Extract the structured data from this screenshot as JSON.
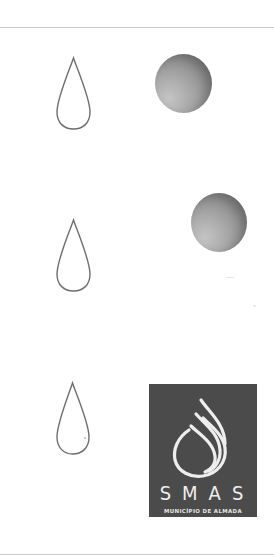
{
  "frame": {
    "top_rule_y": 27,
    "bottom_rule_y": 554,
    "rule_color": "#c9c9c9",
    "background": "#ffffff"
  },
  "rows": [
    {
      "drop": {
        "icon": "teardrop-outline-icon"
      },
      "companion": {
        "icon": "gradient-circle-icon"
      }
    },
    {
      "drop": {
        "icon": "teardrop-outline-icon"
      },
      "companion": {
        "icon": "gradient-circle-icon"
      }
    },
    {
      "drop": {
        "icon": "teardrop-outline-icon"
      },
      "companion": {
        "icon": "smas-logo"
      }
    }
  ],
  "logo": {
    "title": "SMAS",
    "subtitle": "MUNICÍPIO DE ALMADA",
    "mark_icon": "water-drop-flame-icon",
    "background_color": "#4b4b4b",
    "foreground_color": "#eeeeee"
  },
  "colors": {
    "drop_stroke": "#6e6e6e",
    "circle_light": "#c4c4c4",
    "circle_dark": "#727272"
  }
}
